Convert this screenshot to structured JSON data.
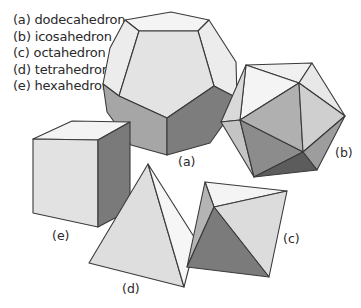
{
  "legend": [
    "(a) dodecahedron",
    "(b) icosahedron",
    "(c) octahedron",
    "(d) tetrahedron",
    "(e) hexahedron"
  ],
  "labels": {
    "a": "(a)",
    "b": "(b)",
    "c": "(c)",
    "d": "(d)",
    "e": "(e)"
  },
  "shades": {
    "lightest": "#f2f2f2",
    "light": "#e0e0e0",
    "mid": "#bdbdbd",
    "midDark": "#9a9a9a",
    "dark": "#7c7c7c",
    "darkest": "#5a5a5a"
  }
}
